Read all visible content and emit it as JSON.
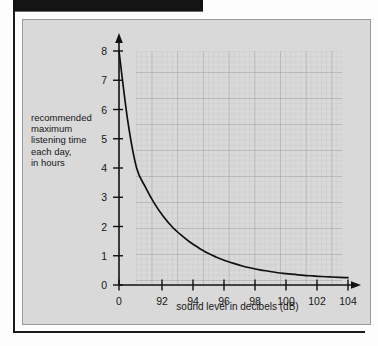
{
  "figure": {
    "y_axis_caption": "recommended\nmaximum\nlistening time\neach day,\nin hours",
    "x_axis_caption": "sound level in decibels (dB)"
  },
  "chart_data": {
    "type": "line",
    "title": "",
    "xlabel": "sound level in decibels (dB)",
    "ylabel": "recommended maximum listening time each day, in hours",
    "xlim": [
      91,
      104
    ],
    "ylim": [
      0,
      8
    ],
    "x_tick_labels": [
      "0",
      "92",
      "94",
      "96",
      "98",
      "100",
      "102",
      "104"
    ],
    "y_tick_labels": [
      "0",
      "1",
      "2",
      "3",
      "4",
      "5",
      "6",
      "7",
      "8"
    ],
    "grid": true,
    "minor_grid": true,
    "legend": "none",
    "broken_x_axis": true,
    "axis_arrows": [
      "x-right",
      "y-up"
    ],
    "x": [
      91,
      91.5,
      92,
      92.5,
      93,
      93.5,
      94,
      94.5,
      95,
      95.5,
      96,
      96.5,
      97,
      97.5,
      98,
      98.5,
      99,
      99.5,
      100,
      100.5,
      101,
      101.5,
      102,
      102.5,
      103,
      103.5,
      104
    ],
    "values": [
      8.0,
      5.6,
      4.0,
      3.35,
      2.8,
      2.36,
      2.0,
      1.72,
      1.48,
      1.28,
      1.1,
      0.96,
      0.84,
      0.74,
      0.65,
      0.58,
      0.52,
      0.47,
      0.42,
      0.39,
      0.36,
      0.33,
      0.31,
      0.29,
      0.275,
      0.26,
      0.25
    ],
    "labelled_points": [
      {
        "x": "0",
        "y": 8.0
      },
      {
        "x": "92",
        "y": 4.0
      },
      {
        "x": "94",
        "y": 2.8
      },
      {
        "x": "96",
        "y": 2.0
      },
      {
        "x": "98",
        "y": 1.35
      },
      {
        "x": "100",
        "y": 0.85
      },
      {
        "x": "102",
        "y": 0.5
      },
      {
        "x": "104",
        "y": 0.25
      }
    ],
    "colors": {
      "panel": "#d9d9d9",
      "curve": "#111111",
      "axis": "#111111",
      "major_grid": "#9d9d9d",
      "minor_grid": "#c2c2c2"
    }
  }
}
